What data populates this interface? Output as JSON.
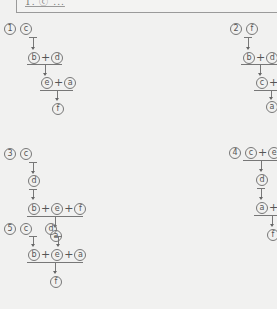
{
  "header": {
    "question_line": "1. ⓒ ..."
  },
  "options": [
    {
      "number": "①",
      "rows": [
        [
          "ⓒ"
        ],
        [
          "ⓑ",
          "ⓓ"
        ],
        [
          "ⓔ",
          "ⓐ"
        ],
        [
          "ⓕ"
        ]
      ]
    },
    {
      "number": "②",
      "rows": [
        [
          "ⓕ"
        ],
        [
          "ⓑ",
          "ⓓ"
        ],
        [
          "ⓒ",
          "+"
        ],
        [
          "ⓐ"
        ]
      ]
    },
    {
      "number": "③",
      "rows": [
        [
          "ⓒ"
        ],
        [
          "ⓓ"
        ],
        [
          "ⓑ",
          "ⓔ",
          "ⓕ"
        ],
        [
          "ⓐ"
        ]
      ]
    },
    {
      "number": "④",
      "rows": [
        [
          "ⓒ",
          "ⓔ"
        ],
        [
          "ⓓ"
        ],
        [
          "ⓐ",
          "+"
        ],
        [
          "ⓕ"
        ]
      ]
    },
    {
      "number": "⑤",
      "rows": [
        [
          "ⓒ",
          "ⓓ"
        ],
        [
          "ⓑ",
          "ⓔ",
          "ⓐ"
        ],
        [
          "ⓕ"
        ]
      ]
    }
  ],
  "labels": {
    "n1": "1",
    "n2": "2",
    "n3": "3",
    "n4": "4",
    "n5": "5",
    "a": "a",
    "b": "b",
    "c": "c",
    "d": "d",
    "e": "e",
    "f": "f",
    "plus": "+"
  }
}
